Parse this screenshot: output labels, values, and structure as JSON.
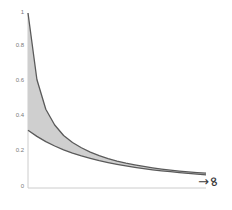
{
  "chart_data": {
    "type": "area",
    "title": "",
    "xlabel": "",
    "ylabel": "",
    "xlim": [
      0,
      1
    ],
    "ylim": [
      0,
      1
    ],
    "grid": false,
    "legend": null,
    "y_ticks": [
      "1",
      "0.8",
      "0.6",
      "0.4",
      "0.2",
      "0"
    ],
    "y_tick_values": [
      1,
      0.8,
      0.6,
      0.4,
      0.2,
      0
    ],
    "x_ticks": [],
    "x_annotation": "→ ∞",
    "x_annotation_arrow": "→",
    "x_annotation_symbol": "∞",
    "fill_color": "#cfcfcf",
    "line_color": "#5a5a5a",
    "axis_color": "#cccccc",
    "tick_label_color": "#7a7a7a",
    "x": [
      0.0,
      0.05,
      0.1,
      0.15,
      0.2,
      0.25,
      0.3,
      0.35,
      0.4,
      0.45,
      0.5,
      0.55,
      0.6,
      0.65,
      0.7,
      0.75,
      0.8,
      0.85,
      0.9,
      0.95,
      1.0
    ],
    "series": [
      {
        "name": "upper-bound-curve",
        "values": [
          1.0,
          0.62,
          0.45,
          0.36,
          0.3,
          0.26,
          0.23,
          0.205,
          0.185,
          0.168,
          0.154,
          0.142,
          0.132,
          0.123,
          0.115,
          0.108,
          0.102,
          0.097,
          0.092,
          0.088,
          0.085
        ]
      },
      {
        "name": "lower-bound-curve",
        "values": [
          0.33,
          0.295,
          0.265,
          0.24,
          0.218,
          0.199,
          0.183,
          0.169,
          0.156,
          0.145,
          0.135,
          0.126,
          0.118,
          0.111,
          0.104,
          0.098,
          0.093,
          0.088,
          0.083,
          0.079,
          0.075
        ]
      }
    ],
    "shaded_region": {
      "name": "between-curves-band",
      "between": [
        "upper-bound-curve",
        "lower-bound-curve"
      ]
    }
  }
}
